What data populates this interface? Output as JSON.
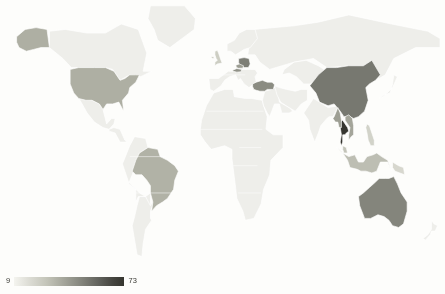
{
  "figure": {
    "background_color": "#fdfdfb",
    "width": 445,
    "height": 294
  },
  "legend": {
    "min_label": "9",
    "max_label": "73",
    "orientation": "horizontal",
    "position": "bottom-left",
    "low_color": "#f4f4ef",
    "high_color": "#35352f"
  },
  "chart_data": {
    "type": "heatmap",
    "subtype": "choropleth-world-map",
    "title": "",
    "xlabel": "",
    "ylabel": "",
    "projection": "equirectangular",
    "grid": false,
    "legend_position": "bottom-left",
    "value_range": [
      9,
      73
    ],
    "colormap": "light-to-dark grayscale (greys)",
    "no_data_color": "#eeeeea",
    "border_color": "#ffffff",
    "categories": [
      "Thailand",
      "China",
      "Australia",
      "Poland",
      "Turkey",
      "United States of America",
      "Brazil",
      "Austria",
      "Czechia",
      "Myanmar",
      "Vietnam",
      "United Kingdom",
      "Indonesia",
      "Malaysia",
      "Philippines",
      "Papua New Guinea"
    ],
    "values": [
      73,
      52,
      48,
      50,
      46,
      35,
      34,
      44,
      41,
      40,
      38,
      24,
      30,
      28,
      22,
      20
    ],
    "no_data_regions": [
      "Canada",
      "Greenland",
      "Russia",
      "India",
      "Mexico",
      "Argentina",
      "Africa",
      "Middle East",
      "Scandinavia",
      "Antarctica"
    ]
  }
}
